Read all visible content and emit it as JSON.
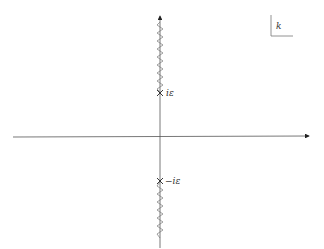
{
  "diagram": {
    "plane_label": "k",
    "upper_point_label": "iε",
    "lower_point_label": "−iε",
    "colors": {
      "axis": "#555555",
      "cut": "#777777",
      "text": "#333333"
    },
    "elements": {
      "real_axis": "horizontal axis with arrow to the right",
      "imaginary_axis": "vertical axis with arrow upward",
      "upper_branch_cut": "zigzag from iε upward",
      "lower_branch_cut": "zigzag from −iε downward",
      "upper_branch_point": "cross marker at iε",
      "lower_branch_point": "cross marker at −iε"
    }
  }
}
